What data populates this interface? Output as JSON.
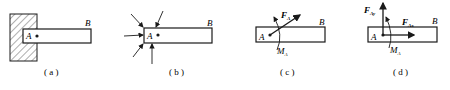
{
  "figures": [
    {
      "id": "a",
      "caption": "( a )",
      "labels": {
        "A": "A",
        "B": "B"
      }
    },
    {
      "id": "b",
      "caption": "( b )",
      "labels": {
        "A": "A",
        "B": "B"
      }
    },
    {
      "id": "c",
      "caption": "( c )",
      "labels": {
        "A": "A",
        "B": "B",
        "force": "F",
        "force_sub": "A",
        "moment": "M",
        "moment_sub": "A"
      }
    },
    {
      "id": "d",
      "caption": "( d )",
      "labels": {
        "A": "A",
        "B": "B",
        "fy": "F",
        "fy_sub": "Ay",
        "fx": "F",
        "fx_sub": "Ax",
        "moment": "M",
        "moment_sub": "A"
      }
    }
  ],
  "colors": {
    "ink": "#1a1a1a",
    "background": "#ffffff"
  }
}
